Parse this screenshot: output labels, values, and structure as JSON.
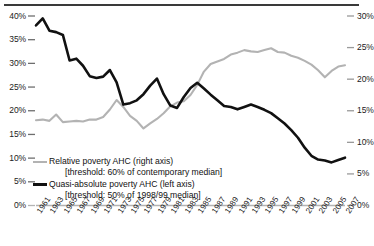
{
  "chart_data": {
    "type": "line",
    "title": "",
    "xlabel": "",
    "ylabel": "",
    "grid": false,
    "legend_position": "inside-bottom-left",
    "x": [
      1961,
      1962,
      1963,
      1964,
      1965,
      1966,
      1967,
      1968,
      1969,
      1970,
      1971,
      1972,
      1973,
      1974,
      1975,
      1976,
      1977,
      1978,
      1979,
      1980,
      1981,
      1982,
      1983,
      1984,
      1985,
      1986,
      1987,
      1988,
      1989,
      1990,
      1991,
      1992,
      1993,
      1994,
      1995,
      1996,
      1997,
      1998,
      1999,
      2000,
      2001,
      2002,
      2003,
      2004,
      2005,
      2006,
      2007
    ],
    "xtick_labels": [
      "1961",
      "1963",
      "1965",
      "1967",
      "1969",
      "1971",
      "1973",
      "1975",
      "1977",
      "1979",
      "1981",
      "1983",
      "1985",
      "1987",
      "1989",
      "1991",
      "1993",
      "1995",
      "1997",
      "1999",
      "2001",
      "2003",
      "2005",
      "2007"
    ],
    "left_axis": {
      "ticks": [
        "0%",
        "5%",
        "10%",
        "15%",
        "20%",
        "25%",
        "30%",
        "35%",
        "40%"
      ],
      "min": 0,
      "max": 40,
      "step": 5
    },
    "right_axis": {
      "ticks": [
        "0%",
        "5%",
        "10%",
        "15%",
        "20%",
        "25%",
        "30%"
      ],
      "min": 0,
      "max": 30,
      "step": 5
    },
    "series": [
      {
        "name": "Relative poverty AHC (right axis)",
        "threshold": "[threshold: 60% of contemporary median]",
        "axis": "right",
        "color": "#b3b3b3",
        "values": [
          13.5,
          13.6,
          13.4,
          14.4,
          13.2,
          13.3,
          13.4,
          13.3,
          13.6,
          13.6,
          14.0,
          15.2,
          16.7,
          15.6,
          14.2,
          13.4,
          12.2,
          13.0,
          13.7,
          14.6,
          15.7,
          16.3,
          16.5,
          17.5,
          19.1,
          21.2,
          22.4,
          22.8,
          23.2,
          23.9,
          24.2,
          24.6,
          24.4,
          24.3,
          24.6,
          24.9,
          24.3,
          24.2,
          23.7,
          23.4,
          22.9,
          22.3,
          21.4,
          20.3,
          21.3,
          22.0,
          22.2
        ]
      },
      {
        "name": "Quasi-absolute poverty AHC (left axis)",
        "threshold": "[threshold: 50% of 1998/99 median]",
        "axis": "left",
        "color": "#111111",
        "values": [
          38.0,
          39.5,
          36.9,
          36.6,
          36.0,
          30.6,
          31.0,
          29.5,
          27.3,
          26.9,
          27.2,
          28.6,
          26.0,
          21.3,
          21.6,
          22.2,
          23.5,
          25.3,
          26.8,
          23.5,
          21.1,
          20.6,
          22.9,
          24.8,
          25.9,
          24.7,
          23.4,
          22.2,
          21.0,
          20.8,
          20.3,
          20.8,
          21.3,
          20.8,
          20.2,
          19.5,
          18.4,
          17.3,
          15.9,
          14.3,
          12.2,
          10.5,
          9.7,
          9.5,
          9.1,
          9.6,
          10.1
        ]
      }
    ]
  },
  "legend": {
    "relative_label": "Relative poverty AHC (right axis)",
    "relative_threshold": "[threshold: 60% of contemporary median]",
    "quasi_label": "Quasi-absolute poverty AHC (left axis)",
    "quasi_threshold": "[threshold: 50% of 1998/99 median]"
  },
  "colors": {
    "grey_series": "#b3b3b3",
    "black_series": "#111111",
    "axis_text": "#222222",
    "top_rule": "#3a3a3a"
  }
}
